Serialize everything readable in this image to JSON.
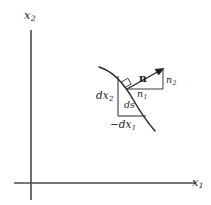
{
  "figure": {
    "background_color": "#ffffff",
    "axes": {
      "x_axis_label": "x",
      "x_axis_subscript": "1",
      "y_axis_label": "x",
      "y_axis_subscript": "2",
      "axis_color": "#4a4a52"
    },
    "curve": {
      "name": "boundary-curve",
      "color": "#2b2b2b"
    },
    "labels": {
      "dx2": {
        "base": "dx",
        "sub": "2"
      },
      "minus_dx1": {
        "base": "−dx",
        "sub": "1"
      },
      "ds": {
        "base": "ds",
        "sub": ""
      },
      "n_vector": {
        "base": "n",
        "sub": ""
      },
      "n1": {
        "base": "n",
        "sub": "1"
      },
      "n2": {
        "base": "n",
        "sub": "2"
      }
    },
    "annotations": {
      "right_angle_marker": "right-angle-mark"
    }
  }
}
